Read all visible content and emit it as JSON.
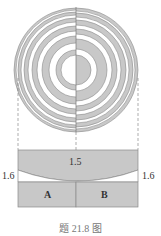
{
  "figure": {
    "caption": "题 21.8 图",
    "colors": {
      "fill": "#c8c8c8",
      "stroke": "#8a8a8a",
      "background": "#ffffff"
    },
    "rings": {
      "center": [
        76,
        70
      ],
      "right_half_boundaries": [
        15,
        21,
        31,
        36,
        41,
        45,
        50,
        53,
        57,
        59,
        62
      ],
      "right_half_starts_with": "gray",
      "left_half_starts_with": "white"
    },
    "labels": {
      "lens_index": "1.5",
      "left_medium_index": "1.6",
      "right_medium_index": "1.6",
      "region_a": "A",
      "region_b": "B"
    }
  }
}
